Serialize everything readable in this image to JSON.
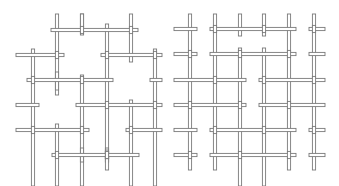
{
  "figure": {
    "stroke_color": "#7a7a7a",
    "fill_color": "#ffffff",
    "rod_width": 3.2,
    "panels": [
      {
        "name": "left-lattice",
        "rods": [
          {
            "o": "h",
            "x1": 51,
            "x2": 138,
            "y": 30
          },
          {
            "o": "h",
            "x1": 16,
            "x2": 64,
            "y": 55
          },
          {
            "o": "h",
            "x1": 101,
            "x2": 162,
            "y": 55
          },
          {
            "o": "h",
            "x1": 27,
            "x2": 113,
            "y": 80
          },
          {
            "o": "h",
            "x1": 150,
            "x2": 162,
            "y": 80
          },
          {
            "o": "h",
            "x1": 16,
            "x2": 39,
            "y": 105
          },
          {
            "o": "h",
            "x1": 76,
            "x2": 162,
            "y": 105
          },
          {
            "o": "h",
            "x1": 16,
            "x2": 89,
            "y": 130
          },
          {
            "o": "h",
            "x1": 126,
            "x2": 162,
            "y": 130
          },
          {
            "o": "h",
            "x1": 52,
            "x2": 139,
            "y": 155
          },
          {
            "o": "v",
            "x": 57,
            "y1": 14,
            "y2": 95
          },
          {
            "o": "v",
            "x": 82,
            "y1": 14,
            "y2": 27
          },
          {
            "o": "v",
            "x": 107,
            "y1": 24,
            "y2": 162
          },
          {
            "o": "v",
            "x": 131,
            "y1": 14,
            "y2": 62
          },
          {
            "o": "v",
            "x": 33,
            "y1": 49,
            "y2": 186
          },
          {
            "o": "v",
            "x": 155,
            "y1": 49,
            "y2": 186
          },
          {
            "o": "v",
            "x": 82,
            "y1": 75,
            "y2": 186
          },
          {
            "o": "v",
            "x": 57,
            "y1": 124,
            "y2": 186
          },
          {
            "o": "v",
            "x": 131,
            "y1": 100,
            "y2": 186
          },
          {
            "o": "v",
            "x": 57,
            "y1": 72,
            "y2": 90
          },
          {
            "o": "v",
            "x": 82,
            "y1": 148,
            "y2": 162
          },
          {
            "o": "v",
            "x": 107,
            "y1": 148,
            "y2": 162
          },
          {
            "o": "v",
            "x": 107,
            "y1": 150,
            "y2": 170
          },
          {
            "o": "v",
            "x": 82,
            "y1": 14,
            "y2": 35
          }
        ]
      },
      {
        "name": "right-lattice",
        "rods": [
          {
            "o": "h",
            "x1": 174,
            "x2": 197,
            "y": 29
          },
          {
            "o": "h",
            "x1": 210,
            "x2": 296,
            "y": 29
          },
          {
            "o": "h",
            "x1": 309,
            "x2": 325,
            "y": 29
          },
          {
            "o": "h",
            "x1": 174,
            "x2": 197,
            "y": 54
          },
          {
            "o": "h",
            "x1": 210,
            "x2": 296,
            "y": 54
          },
          {
            "o": "h",
            "x1": 309,
            "x2": 325,
            "y": 54
          },
          {
            "o": "h",
            "x1": 174,
            "x2": 246,
            "y": 80
          },
          {
            "o": "h",
            "x1": 259,
            "x2": 325,
            "y": 80
          },
          {
            "o": "h",
            "x1": 174,
            "x2": 246,
            "y": 105
          },
          {
            "o": "h",
            "x1": 259,
            "x2": 325,
            "y": 105
          },
          {
            "o": "h",
            "x1": 174,
            "x2": 197,
            "y": 130
          },
          {
            "o": "h",
            "x1": 210,
            "x2": 296,
            "y": 130
          },
          {
            "o": "h",
            "x1": 309,
            "x2": 325,
            "y": 130
          },
          {
            "o": "h",
            "x1": 174,
            "x2": 197,
            "y": 155
          },
          {
            "o": "h",
            "x1": 210,
            "x2": 296,
            "y": 155
          },
          {
            "o": "h",
            "x1": 309,
            "x2": 325,
            "y": 155
          },
          {
            "o": "v",
            "x": 190,
            "y1": 14,
            "y2": 170
          },
          {
            "o": "v",
            "x": 215,
            "y1": 14,
            "y2": 170
          },
          {
            "o": "v",
            "x": 240,
            "y1": 14,
            "y2": 36
          },
          {
            "o": "v",
            "x": 264,
            "y1": 14,
            "y2": 36
          },
          {
            "o": "v",
            "x": 240,
            "y1": 48,
            "y2": 186
          },
          {
            "o": "v",
            "x": 264,
            "y1": 48,
            "y2": 186
          },
          {
            "o": "v",
            "x": 289,
            "y1": 14,
            "y2": 170
          },
          {
            "o": "v",
            "x": 314,
            "y1": 14,
            "y2": 170
          }
        ]
      }
    ]
  }
}
